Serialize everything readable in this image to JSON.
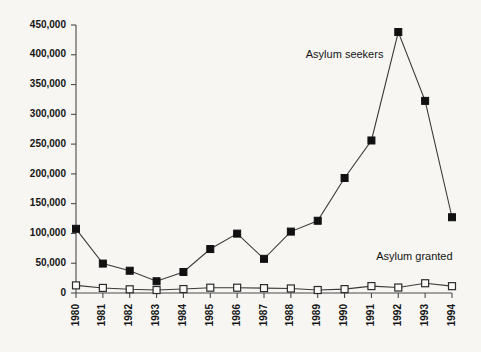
{
  "chart_data": {
    "type": "line",
    "title": "",
    "xlabel": "",
    "ylabel": "",
    "grid": false,
    "legend_position": "inline-annotations",
    "categories": [
      "1980",
      "1981",
      "1982",
      "1983",
      "1984",
      "1985",
      "1986",
      "1987",
      "1988",
      "1989",
      "1990",
      "1991",
      "1992",
      "1993",
      "1994"
    ],
    "x": [
      1980,
      1981,
      1982,
      1983,
      1984,
      1985,
      1986,
      1987,
      1988,
      1989,
      1990,
      1991,
      1992,
      1993,
      1994
    ],
    "ylim": [
      0,
      450000
    ],
    "ytick_values": [
      0,
      50000,
      100000,
      150000,
      200000,
      250000,
      300000,
      350000,
      400000,
      450000
    ],
    "ytick_labels": [
      "0",
      "50,000",
      "100,000",
      "150,000",
      "200,000",
      "250,000",
      "300,000",
      "350,000",
      "400,000",
      "450,000"
    ],
    "series": [
      {
        "name": "Asylum seekers",
        "marker": "filled-square",
        "color": "#111111",
        "values": [
          107800,
          49400,
          37400,
          19700,
          35300,
          73800,
          99700,
          57400,
          103100,
          121300,
          193100,
          256100,
          438200,
          322600,
          127200
        ]
      },
      {
        "name": "Asylum granted",
        "marker": "open-square",
        "color": "#fbfaf8",
        "values": [
          12800,
          8500,
          6200,
          5000,
          6600,
          8900,
          8900,
          8200,
          7600,
          5000,
          6500,
          11600,
          9200,
          16400,
          11500
        ]
      }
    ],
    "annotations": [
      {
        "text": "Asylum seekers",
        "x": 1990.0,
        "y": 400000
      },
      {
        "text": "Asylum granted",
        "x": 1992.6,
        "y": 60000
      }
    ]
  },
  "colors": {
    "background": "#f7f6f3",
    "axis": "#4a4a4a",
    "text": "#151515",
    "series_filled": "#111111",
    "series_open_fill": "#fbfaf8",
    "series_open_stroke": "#2b2b2b"
  }
}
